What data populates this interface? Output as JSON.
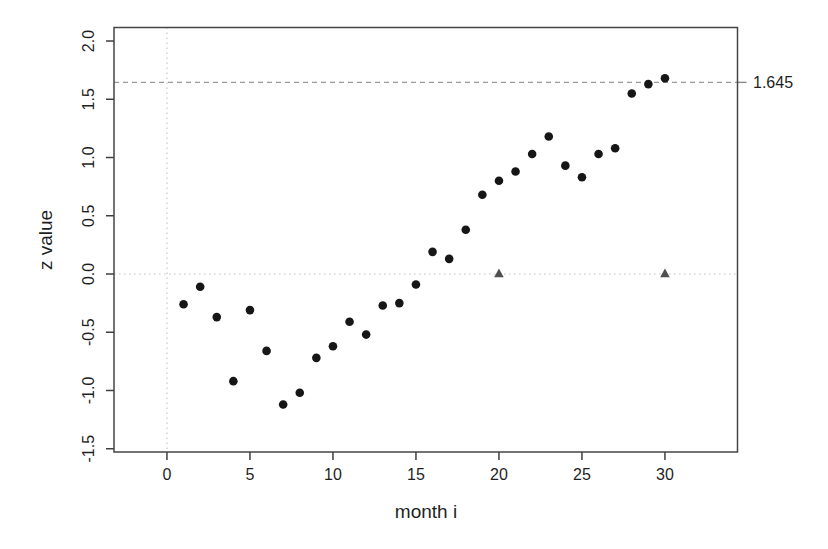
{
  "figure": {
    "background": "#ffffff",
    "axis_color": "#3f3f3f",
    "text_color": "#1f1f1f"
  },
  "chart_data": {
    "type": "scatter",
    "title": "",
    "xlabel": "month i",
    "ylabel": "z value",
    "xlim": [
      -3.19,
      34.37
    ],
    "ylim": [
      -1.528,
      2.116
    ],
    "grid": false,
    "legend": "none",
    "x_ticks": {
      "values": [
        0,
        5,
        10,
        15,
        20,
        25,
        30
      ],
      "labels": [
        "0",
        "5",
        "10",
        "15",
        "20",
        "25",
        "30"
      ]
    },
    "y_ticks": {
      "values": [
        -1.5,
        -1.0,
        -0.5,
        0.0,
        0.5,
        1.0,
        1.5,
        2.0
      ],
      "labels": [
        "-1.5",
        "-1.0",
        "-0.5",
        "0.0",
        "0.5",
        "1.0",
        "1.5",
        "2.0"
      ]
    },
    "reference_lines": [
      {
        "name": "threshold-line",
        "orientation": "horizontal",
        "value": 1.645,
        "style": "dashed",
        "color": "#999999",
        "label": "1.645",
        "label_side": "right"
      },
      {
        "name": "zero-line-horizontal",
        "orientation": "horizontal",
        "value": 0,
        "style": "dotted",
        "color": "#c6c6c6",
        "label": ""
      },
      {
        "name": "zero-line-vertical",
        "orientation": "vertical",
        "value": 0,
        "style": "dotted",
        "color": "#c6c6c6",
        "label": ""
      }
    ],
    "series": [
      {
        "name": "z values by month",
        "marker": "circle",
        "color": "#161616",
        "x": [
          1,
          2,
          3,
          4,
          5,
          6,
          7,
          8,
          9,
          10,
          11,
          12,
          13,
          14,
          15,
          16,
          17,
          18,
          19,
          20,
          21,
          22,
          23,
          24,
          25,
          26,
          27,
          28,
          29,
          30
        ],
        "y": [
          -0.26,
          -0.11,
          -0.37,
          -0.92,
          -0.31,
          -0.66,
          -1.12,
          -1.02,
          -0.72,
          -0.62,
          -0.41,
          -0.52,
          -0.27,
          -0.25,
          -0.09,
          0.19,
          0.13,
          0.38,
          0.68,
          0.8,
          0.88,
          1.03,
          1.18,
          0.93,
          0.83,
          1.03,
          1.08,
          1.55,
          1.63,
          1.68
        ]
      },
      {
        "name": "triangle markers",
        "marker": "triangle",
        "color": "#4f4f4f",
        "x": [
          20,
          30
        ],
        "y": [
          0,
          0
        ]
      }
    ]
  }
}
